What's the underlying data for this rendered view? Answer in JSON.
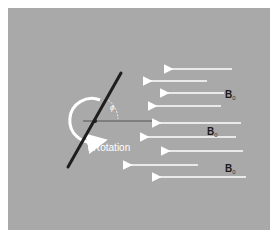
{
  "diagram": {
    "labels": {
      "rotation": "Rotation",
      "angle_symbol": "ϕ",
      "field_main": "B",
      "field_sub": "0"
    },
    "field_labels": [
      {
        "x": 225,
        "y": 89
      },
      {
        "x": 207,
        "y": 126
      },
      {
        "x": 225,
        "y": 163
      }
    ],
    "arrows": [
      {
        "x1": 232,
        "x2": 170,
        "y": 69
      },
      {
        "x1": 207,
        "x2": 149,
        "y": 81
      },
      {
        "x1": 224,
        "x2": 166,
        "y": 93
      },
      {
        "x1": 221,
        "x2": 154,
        "y": 106
      },
      {
        "x1": 241,
        "x2": 158,
        "y": 123
      },
      {
        "x1": 236,
        "x2": 146,
        "y": 137
      },
      {
        "x1": 243,
        "x2": 167,
        "y": 151
      },
      {
        "x1": 198,
        "x2": 129,
        "y": 165
      },
      {
        "x1": 246,
        "x2": 158,
        "y": 177
      }
    ],
    "colors": {
      "background": "#a9a9a9",
      "arrows": "#ffffff",
      "rod": "#1e1e1e",
      "reference_line": "#555555",
      "text": "#1a1a1a"
    }
  }
}
